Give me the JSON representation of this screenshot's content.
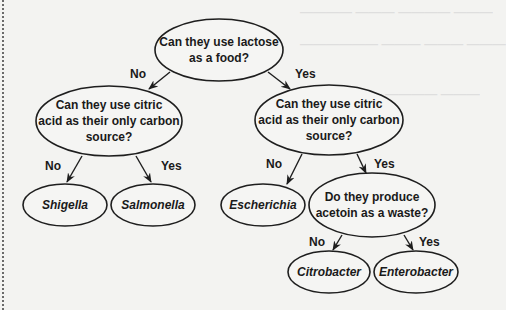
{
  "diagram": {
    "type": "decision-tree",
    "nodes": [
      {
        "id": "lactose",
        "kind": "question",
        "lines": [
          "Can they use lactose",
          "as a food?"
        ]
      },
      {
        "id": "citric-left",
        "kind": "question",
        "lines": [
          "Can they use citric",
          "acid as their only carbon",
          "source?"
        ]
      },
      {
        "id": "citric-right",
        "kind": "question",
        "lines": [
          "Can they use citric",
          "acid as their only carbon",
          "source?"
        ]
      },
      {
        "id": "shigella",
        "kind": "leaf",
        "lines": [
          "Shigella"
        ]
      },
      {
        "id": "salmonella",
        "kind": "leaf",
        "lines": [
          "Salmonella"
        ]
      },
      {
        "id": "escherichia",
        "kind": "leaf",
        "lines": [
          "Escherichia"
        ]
      },
      {
        "id": "acetoin",
        "kind": "question",
        "lines": [
          "Do they produce",
          "acetoin as a waste?"
        ]
      },
      {
        "id": "citrobacter",
        "kind": "leaf",
        "lines": [
          "Citrobacter"
        ]
      },
      {
        "id": "enterobacter",
        "kind": "leaf",
        "lines": [
          "Enterobacter"
        ]
      }
    ],
    "edges": [
      {
        "from": "lactose",
        "to": "citric-left",
        "label": "No"
      },
      {
        "from": "lactose",
        "to": "citric-right",
        "label": "Yes"
      },
      {
        "from": "citric-left",
        "to": "shigella",
        "label": "No"
      },
      {
        "from": "citric-left",
        "to": "salmonella",
        "label": "Yes"
      },
      {
        "from": "citric-right",
        "to": "escherichia",
        "label": "No"
      },
      {
        "from": "citric-right",
        "to": "acetoin",
        "label": "Yes"
      },
      {
        "from": "acetoin",
        "to": "citrobacter",
        "label": "No"
      },
      {
        "from": "acetoin",
        "to": "enterobacter",
        "label": "Yes"
      }
    ]
  }
}
